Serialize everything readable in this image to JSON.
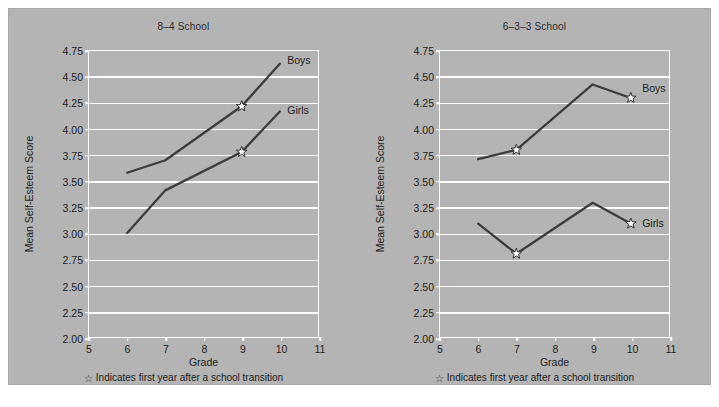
{
  "figure": {
    "background_color": "#b4b4b4",
    "grid_color": "#ffffff",
    "line_color": "#3c3c3c",
    "text_color": "#1d1d1d"
  },
  "footnote": {
    "star_glyph": "☆",
    "text": "Indicates first year after a school transition"
  },
  "chart_data": [
    {
      "type": "line",
      "title": "8–4 School",
      "xlabel": "Grade",
      "ylabel": "Mean Self-Esteem Score",
      "xlim": [
        5,
        11
      ],
      "ylim": [
        2.0,
        4.75
      ],
      "xticks": [
        "5",
        "6",
        "7",
        "8",
        "9",
        "10",
        "11"
      ],
      "xtick_values": [
        5,
        6,
        7,
        8,
        9,
        10,
        11
      ],
      "yticks": [
        "2.00",
        "2.25",
        "2.50",
        "2.75",
        "3.00",
        "3.25",
        "3.50",
        "3.75",
        "4.00",
        "4.25",
        "4.50",
        "4.75"
      ],
      "ytick_values": [
        2.0,
        2.25,
        2.5,
        2.75,
        3.0,
        3.25,
        3.5,
        3.75,
        4.0,
        4.25,
        4.5,
        4.75
      ],
      "grid": "horizontal",
      "legend_position": "inline-end-of-line",
      "series": [
        {
          "name": "Boys",
          "x": [
            6,
            7,
            9,
            10
          ],
          "values": [
            3.58,
            3.7,
            4.22,
            4.63
          ],
          "transition_markers": [
            9
          ],
          "label_x": 10.15,
          "label_y": 4.66
        },
        {
          "name": "Girls",
          "x": [
            6,
            7,
            9,
            10
          ],
          "values": [
            3.0,
            3.41,
            3.78,
            4.17
          ],
          "transition_markers": [
            9
          ],
          "label_x": 10.15,
          "label_y": 4.19
        }
      ]
    },
    {
      "type": "line",
      "title": "6–3–3 School",
      "xlabel": "Grade",
      "ylabel": "Mean Self-Esteem Score",
      "xlim": [
        5,
        11
      ],
      "ylim": [
        2.0,
        4.75
      ],
      "xticks": [
        "5",
        "6",
        "7",
        "8",
        "9",
        "10",
        "11"
      ],
      "xtick_values": [
        5,
        6,
        7,
        8,
        9,
        10,
        11
      ],
      "yticks": [
        "2.00",
        "2.25",
        "2.50",
        "2.75",
        "3.00",
        "3.25",
        "3.50",
        "3.75",
        "4.00",
        "4.25",
        "4.50",
        "4.75"
      ],
      "ytick_values": [
        2.0,
        2.25,
        2.5,
        2.75,
        3.0,
        3.25,
        3.5,
        3.75,
        4.0,
        4.25,
        4.5,
        4.75
      ],
      "grid": "horizontal",
      "legend_position": "inline-end-of-line",
      "series": [
        {
          "name": "Boys",
          "x": [
            6,
            7,
            9,
            10
          ],
          "values": [
            3.71,
            3.8,
            4.43,
            4.3
          ],
          "transition_markers": [
            7,
            10
          ],
          "label_x": 10.25,
          "label_y": 4.4
        },
        {
          "name": "Girls",
          "x": [
            6,
            7,
            9,
            10
          ],
          "values": [
            3.09,
            2.8,
            3.29,
            3.09
          ],
          "transition_markers": [
            7,
            10
          ],
          "label_x": 10.25,
          "label_y": 3.11
        }
      ]
    }
  ]
}
